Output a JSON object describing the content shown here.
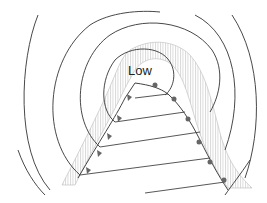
{
  "diagram": {
    "type": "weather-map",
    "center_label": "Low",
    "colors": {
      "isobar": "#333333",
      "front": "#444444",
      "hatch": "#bbbbbb",
      "symbol": "#666666",
      "background": "#ffffff"
    },
    "elements": [
      {
        "name": "isobars",
        "count": 4,
        "style": "concentric curves around low"
      },
      {
        "name": "cold-front",
        "symbol": "triangles",
        "side": "left"
      },
      {
        "name": "warm-front",
        "symbol": "semicircles",
        "side": "right"
      },
      {
        "name": "precipitation-band",
        "style": "vertical hatching"
      }
    ]
  }
}
